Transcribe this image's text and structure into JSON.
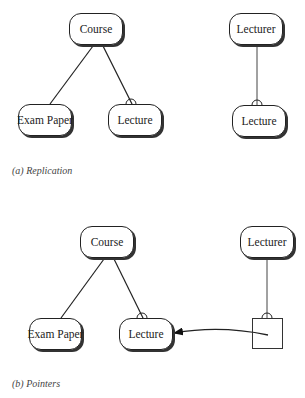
{
  "panel_a": {
    "caption": "(a) Replication",
    "nodes": {
      "course": "Course",
      "exam_paper": "Exam Paper",
      "lecture": "Lecture",
      "lecturer": "Lecturer",
      "lecture_replica": "Lecture"
    }
  },
  "panel_b": {
    "caption": "(b) Pointers",
    "nodes": {
      "course": "Course",
      "exam_paper": "Exam Paper",
      "lecture": "Lecture",
      "lecturer": "Lecturer"
    }
  }
}
